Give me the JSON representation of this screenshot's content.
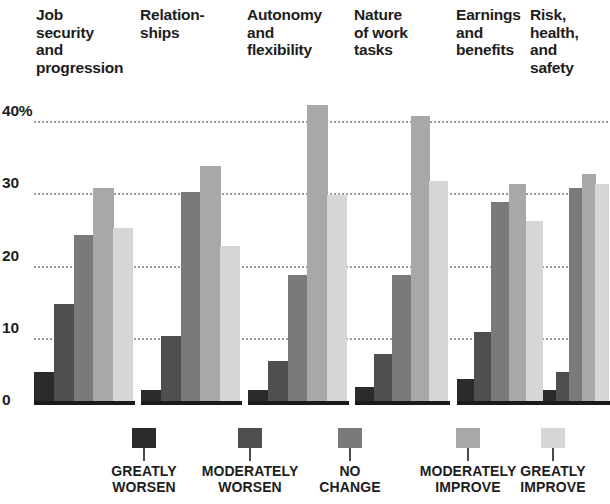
{
  "chart_data": {
    "type": "bar",
    "title": "",
    "xlabel": "",
    "ylabel": "",
    "ylim": [
      0,
      44
    ],
    "grid": true,
    "legend_position": "bottom",
    "ytick_labels": [
      "40%",
      "30",
      "20",
      "10",
      "0"
    ],
    "ytick_values": [
      40,
      30,
      20,
      10,
      0
    ],
    "categories": [
      "Job\nsecurity\nand\nprogression",
      "Relation-\nships",
      "Autonomy\nand\nflexibility",
      "Nature\nof work\ntasks",
      "Earnings\nand\nbenefits",
      "Risk,\nhealth,\nand\nsafety"
    ],
    "series": [
      {
        "name": "GREATLY\nWORSEN",
        "color": "#2b2b2b",
        "values": [
          4.0,
          1.5,
          1.5,
          2.0,
          3.0,
          1.5
        ]
      },
      {
        "name": "MODERATELY\nWORSEN",
        "color": "#4f4f4f",
        "values": [
          13.5,
          9.0,
          5.5,
          6.5,
          9.5,
          4.0
        ]
      },
      {
        "name": "NO\nCHANGE",
        "color": "#7a7a7a",
        "values": [
          23.0,
          29.0,
          17.5,
          17.5,
          27.5,
          29.5
        ]
      },
      {
        "name": "MODERATELY\nIMPROVE",
        "color": "#a8a8a8",
        "values": [
          29.5,
          32.5,
          41.0,
          39.5,
          30.0,
          31.5
        ]
      },
      {
        "name": "GREATLY\nIMPROVE",
        "color": "#d6d6d6",
        "values": [
          24.0,
          21.5,
          28.5,
          30.5,
          25.0,
          30.0
        ]
      }
    ]
  },
  "legend": {
    "items": [
      {
        "label": "GREATLY\nWORSEN",
        "color": "#2b2b2b"
      },
      {
        "label": "MODERATELY\nWORSEN",
        "color": "#4f4f4f"
      },
      {
        "label": "NO\nCHANGE",
        "color": "#7a7a7a"
      },
      {
        "label": "MODERATELY\nIMPROVE",
        "color": "#a8a8a8"
      },
      {
        "label": "GREATLY\nIMPROVE",
        "color": "#d6d6d6"
      }
    ]
  }
}
